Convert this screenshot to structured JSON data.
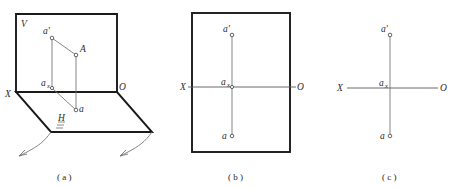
{
  "figure": {
    "type": "descriptive-geometry-projection",
    "panels": [
      {
        "id": "a",
        "caption": "( a )",
        "kind": "pictorial-two-plane",
        "labels": {
          "v_plane": "V",
          "h_plane": "H",
          "x_axis": "X",
          "origin": "O",
          "space_point": "A",
          "front_projection": "a'",
          "horizontal_projection": "a",
          "axis_point": "a",
          "axis_point_sub": "x"
        }
      },
      {
        "id": "b",
        "caption": "( b )",
        "kind": "framed-projection",
        "labels": {
          "x_axis": "X",
          "origin": "O",
          "front_projection": "a'",
          "horizontal_projection": "a",
          "axis_point": "a",
          "axis_point_sub": "x"
        }
      },
      {
        "id": "c",
        "caption": "( c )",
        "kind": "bare-projection",
        "labels": {
          "x_axis": "X",
          "origin": "O",
          "front_projection": "a'",
          "horizontal_projection": "a",
          "axis_point": "a",
          "axis_point_sub": "x"
        }
      }
    ]
  },
  "colors": {
    "ink_heavy": "#1a1a1a",
    "ink_light": "#6f6f6f",
    "axis": "#5a5a5a",
    "text": "#2b2b2b",
    "paper": "#ffffff"
  }
}
